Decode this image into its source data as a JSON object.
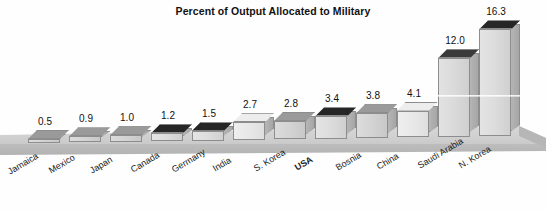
{
  "chart_data": {
    "type": "bar",
    "title": "Percent of Output Allocated to Military",
    "xlabel": "",
    "ylabel": "",
    "ylim": [
      0,
      17
    ],
    "grid": false,
    "legend": "none",
    "categories": [
      "Jamaica",
      "Mexico",
      "Japan",
      "Canada",
      "Germany",
      "India",
      "S. Korea",
      "USA",
      "Bosnia",
      "China",
      "Saudi Arabia",
      "N. Korea"
    ],
    "values": [
      0.5,
      0.9,
      1.0,
      1.2,
      1.5,
      2.7,
      2.8,
      3.4,
      3.8,
      4.1,
      12.0,
      16.3
    ],
    "value_labels": [
      "0.5",
      "0.9",
      "1.0",
      "1.2",
      "1.5",
      "2.7",
      "2.8",
      "3.4",
      "3.8",
      "4.1",
      "12.0",
      "16.3"
    ],
    "emphasized_category": "USA",
    "bar_shades": [
      "mid",
      "mid",
      "mid",
      "vdark",
      "vdark",
      "light",
      "mid",
      "vdark",
      "mid",
      "light",
      "dark",
      "vdark"
    ],
    "colors": {
      "bar_face_light": "#eeeeee",
      "bar_face_mid": "#dcdcdc",
      "bar_top_light": "#ededed",
      "bar_top_mid": "#9a9a9a",
      "bar_top_dark": "#3a3a3a",
      "bar_top_verydark": "#262626",
      "bar_outline": "#8d8d8d",
      "floor": "#cfcfcf",
      "background": "#fefefe",
      "text": "#111111"
    }
  }
}
